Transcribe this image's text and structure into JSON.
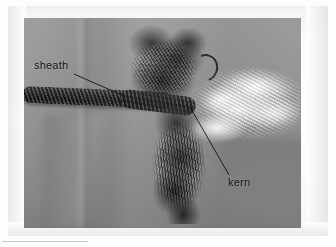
{
  "figure": {
    "type": "photograph",
    "colorspace": "grayscale",
    "background_color": "#ffffff",
    "photo_background_color": "#8d8d8d",
    "sheath_color": "#222222",
    "kern_color": "#f7f7f7",
    "annotation_color": "#111111"
  },
  "annotations": [
    {
      "id": "sheath",
      "label": "sheath",
      "leader": {
        "from_x": 74,
        "from_y": 74,
        "to_x": 124,
        "to_y": 96
      },
      "points_to": "braided outer sheath of the cord"
    },
    {
      "id": "kern",
      "label": "kern",
      "leader": {
        "from_x": 229,
        "from_y": 175,
        "to_x": 190,
        "to_y": 107
      },
      "points_to": "white inner core fibers"
    }
  ],
  "photo_frame": {
    "x": 24,
    "y": 18,
    "width": 277,
    "height": 210
  }
}
